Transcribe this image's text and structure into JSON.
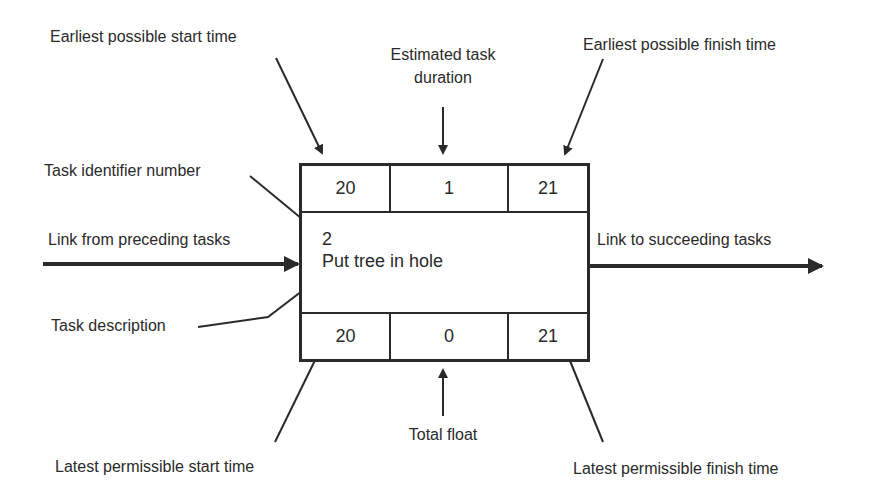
{
  "diagram": {
    "type": "activity-on-node",
    "node": {
      "earliest_start": "20",
      "duration": "1",
      "earliest_finish": "21",
      "task_id": "2",
      "description": "Put tree in hole",
      "latest_start": "20",
      "total_float": "0",
      "latest_finish": "21"
    },
    "labels": {
      "earliest_start": "Earliest possible start time",
      "duration_line1": "Estimated task",
      "duration_line2": "duration",
      "earliest_finish": "Earliest possible finish time",
      "task_id": "Task identifier number",
      "link_in": "Link from preceding tasks",
      "link_out": "Link to succeeding tasks",
      "description": "Task description",
      "latest_start": "Latest permissible start time",
      "total_float": "Total float",
      "latest_finish": "Latest permissible finish time"
    },
    "colors": {
      "line": "#2a2a2a",
      "background": "#ffffff"
    }
  }
}
